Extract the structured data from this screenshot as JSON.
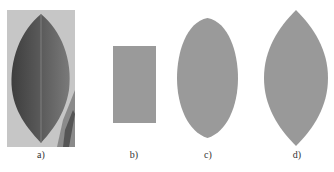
{
  "figure": {
    "panels": [
      {
        "id": "a",
        "label": "a)",
        "description": "photograph of a leaf",
        "fill": "#5a5a5a",
        "background": "#c8c8c8"
      },
      {
        "id": "b",
        "label": "b)",
        "description": "rectangle shape",
        "fill": "#9a9a9a"
      },
      {
        "id": "c",
        "label": "c)",
        "description": "ellipse-like leaf shape",
        "fill": "#9a9a9a"
      },
      {
        "id": "d",
        "label": "d)",
        "description": "pointed leaf shape",
        "fill": "#999999"
      }
    ]
  }
}
